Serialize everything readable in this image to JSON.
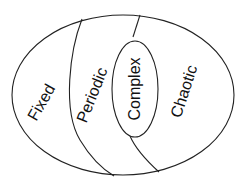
{
  "diagram": {
    "type": "nested-region-diagram",
    "regions": [
      {
        "id": "fixed",
        "label": "Fixed"
      },
      {
        "id": "periodic",
        "label": "Periodic"
      },
      {
        "id": "complex",
        "label": "Complex"
      },
      {
        "id": "chaotic",
        "label": "Chaotic"
      }
    ],
    "colors": {
      "background": "#ffffff",
      "stroke": "#222222",
      "text": "#111111"
    }
  }
}
